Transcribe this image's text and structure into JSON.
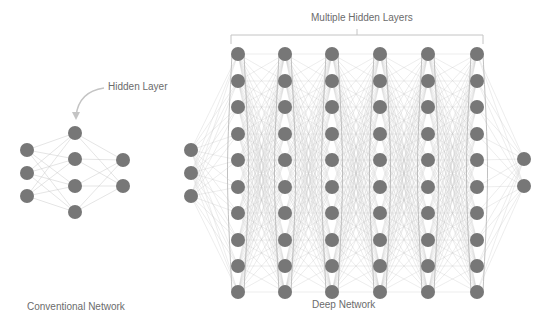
{
  "labels": {
    "hidden_layer": "Hidden Layer",
    "multiple_hidden_layers": "Multiple Hidden Layers",
    "conventional_network": "Conventional Network",
    "deep_network": "Deep Network"
  },
  "colors": {
    "node": "#777777",
    "edge": "#c8c8c8",
    "text": "#6b6b6b"
  },
  "conventional": {
    "layers": [
      {
        "x": 27,
        "ys": [
          150,
          173,
          196
        ]
      },
      {
        "x": 75,
        "ys": [
          133,
          159,
          186,
          212
        ]
      },
      {
        "x": 123,
        "ys": [
          160,
          186
        ]
      }
    ]
  },
  "deep": {
    "layers": [
      {
        "x": 191,
        "ys": [
          150,
          173,
          196
        ]
      },
      {
        "x": 238,
        "ys": [
          54,
          81,
          107,
          134,
          160,
          187,
          213,
          240,
          266,
          292
        ]
      },
      {
        "x": 285,
        "ys": [
          54,
          81,
          107,
          134,
          160,
          187,
          213,
          240,
          266,
          292
        ]
      },
      {
        "x": 332,
        "ys": [
          54,
          81,
          107,
          134,
          160,
          187,
          213,
          240,
          266,
          292
        ]
      },
      {
        "x": 380,
        "ys": [
          54,
          81,
          107,
          134,
          160,
          187,
          213,
          240,
          266,
          292
        ]
      },
      {
        "x": 428,
        "ys": [
          54,
          81,
          107,
          134,
          160,
          187,
          213,
          240,
          266,
          292
        ]
      },
      {
        "x": 477,
        "ys": [
          54,
          81,
          107,
          134,
          160,
          187,
          213,
          240,
          266,
          292
        ]
      },
      {
        "x": 524,
        "ys": [
          159,
          186
        ]
      }
    ]
  }
}
